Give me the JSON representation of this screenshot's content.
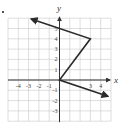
{
  "chart_data": {
    "type": "line",
    "title": "",
    "xlabel": "x",
    "ylabel": "y",
    "xlim": [
      -5,
      5
    ],
    "ylim": [
      -4,
      6
    ],
    "grid": true,
    "x_tick_labels": [
      "-4",
      "-3",
      "-2",
      "-1",
      "3",
      "4"
    ],
    "y_tick_labels": [
      "5",
      "4",
      "3",
      "2",
      "1",
      "-1",
      "-2",
      "-3"
    ],
    "x_ticks": [
      -4,
      -3,
      -2,
      -1,
      3,
      4
    ],
    "y_ticks": [
      5,
      4,
      3,
      2,
      1,
      -1,
      -2,
      -3
    ],
    "series": [
      {
        "name": "graph",
        "points": [
          [
            -2.75,
            5.92
          ],
          [
            3,
            4
          ],
          [
            0,
            0
          ],
          [
            4.7,
            -1.57
          ]
        ],
        "arrow_start": true,
        "arrow_end": true
      }
    ],
    "colors": {
      "grid": "#c8c8c8",
      "axis": "#333333",
      "line": "#2a2a2a",
      "label": "#444444"
    }
  }
}
